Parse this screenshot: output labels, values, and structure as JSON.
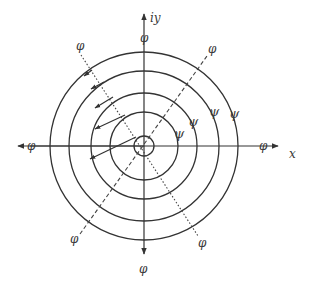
{
  "figure": {
    "center": [
      144,
      146
    ],
    "colors": {
      "ink": "#333333",
      "background": "#ffffff"
    },
    "axes": {
      "x_label": "x",
      "y_label": "iy",
      "x_end_label": "φ",
      "x_start_label": "φ",
      "y_top_label": "φ",
      "y_bottom_label": "φ"
    },
    "circles": {
      "radii": [
        10,
        34,
        53,
        75,
        94
      ],
      "labels": [
        {
          "text": "ψ",
          "x": 174,
          "y": 136
        },
        {
          "text": "ψ",
          "x": 189,
          "y": 126
        },
        {
          "text": "ψ",
          "x": 209,
          "y": 115
        },
        {
          "text": "ψ",
          "x": 230,
          "y": 118
        }
      ]
    },
    "dotted_line": {
      "label_start": "φ",
      "label_end": "φ",
      "from": [
        81,
        55
      ],
      "to": [
        198,
        236
      ]
    },
    "dashed_line": {
      "label_start": "φ",
      "label_end": "φ",
      "from": [
        80,
        234
      ],
      "to": [
        207,
        56
      ]
    },
    "diagonal_labels": {
      "top_left": "φ",
      "top_right": "φ",
      "bottom_left": "φ",
      "bottom_right": "φ"
    },
    "gradient_arrows": [
      {
        "from": [
          92,
          70
        ],
        "to": [
          84,
          76
        ]
      },
      {
        "from": [
          104,
          82
        ],
        "to": [
          91,
          89
        ]
      },
      {
        "from": [
          113,
          97
        ],
        "to": [
          95,
          108
        ]
      },
      {
        "from": [
          125,
          115
        ],
        "to": [
          95,
          129
        ]
      },
      {
        "from": [
          136,
          137
        ],
        "to": [
          90,
          159
        ]
      }
    ]
  }
}
